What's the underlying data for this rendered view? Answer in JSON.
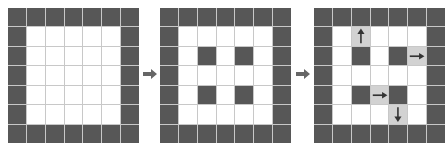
{
  "diagram": {
    "colors": {
      "dark": "#575757",
      "highlight": "#d2d2d2",
      "empty": "#ffffff",
      "gridline": "#c8c8c8",
      "arrow": "#333333",
      "step_arrow": "#666666"
    },
    "grid_size": {
      "rows": 7,
      "cols": 7
    },
    "panels": [
      {
        "id": "panel-1",
        "dark_cells": "border",
        "interior_dark": [],
        "highlight": []
      },
      {
        "id": "panel-2",
        "dark_cells": "border",
        "interior_dark": [
          [
            2,
            2
          ],
          [
            2,
            4
          ],
          [
            4,
            2
          ],
          [
            4,
            4
          ]
        ],
        "highlight": []
      },
      {
        "id": "panel-3",
        "dark_cells": "border",
        "interior_dark": [
          [
            2,
            2
          ],
          [
            2,
            4
          ],
          [
            4,
            2
          ],
          [
            4,
            4
          ]
        ],
        "highlight": [
          {
            "row": 1,
            "col": 2,
            "arrow": "up"
          },
          {
            "row": 2,
            "col": 5,
            "arrow": "right"
          },
          {
            "row": 4,
            "col": 3,
            "arrow": "right"
          },
          {
            "row": 5,
            "col": 4,
            "arrow": "down"
          }
        ]
      }
    ],
    "step_arrows": [
      "right-arrow",
      "right-arrow"
    ]
  }
}
